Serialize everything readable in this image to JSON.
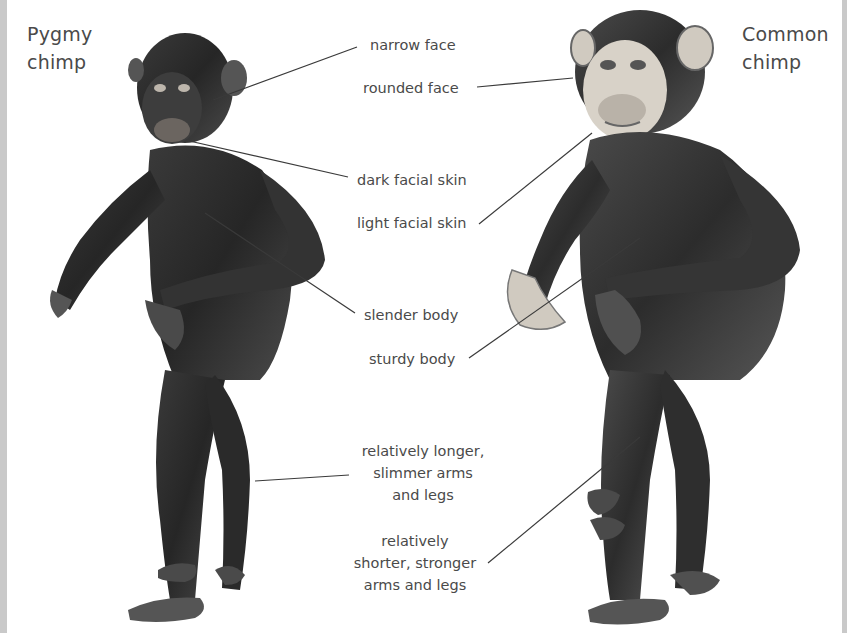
{
  "figure": {
    "left_species": {
      "title_line1": "Pygmy",
      "title_line2": "chimp"
    },
    "right_species": {
      "title_line1": "Common",
      "title_line2": "chimp"
    },
    "labels": {
      "narrow_face": "narrow face",
      "rounded_face": "rounded face",
      "dark_facial_skin": "dark facial skin",
      "light_facial_skin": "light facial skin",
      "slender_body": "slender body",
      "sturdy_body": "sturdy body",
      "longer_limbs": [
        "relatively longer,",
        "slimmer arms",
        "and legs"
      ],
      "shorter_limbs": [
        "relatively",
        "shorter, stronger",
        "arms and legs"
      ]
    },
    "colors": {
      "text": "#4a4a4a",
      "leader_line": "#3a3a3a",
      "border": "#c9c9c9",
      "fur_dark": "#2e2e2e",
      "fur_mid": "#555555",
      "skin_light": "#d8d2c8"
    }
  }
}
